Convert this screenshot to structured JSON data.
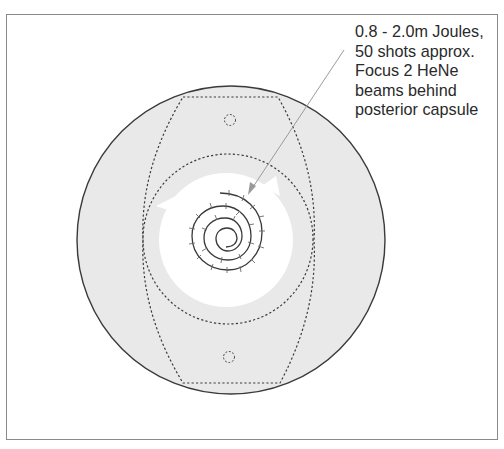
{
  "annotation": {
    "lines": [
      "0.8 - 2.0m Joules,",
      "50 shots approx.",
      "Focus 2 HeNe",
      "beams behind",
      "posterior capsule"
    ]
  },
  "colors": {
    "background": "#ffffff",
    "outer_circle_fill": "#e9e9e9",
    "outer_circle_stroke": "#3a3a3a",
    "inner_clear_zone": "#ffffff",
    "dashed_lines": "#3a3a3a",
    "spiral": "#3a3a3a",
    "pointer_line": "#9a9a9a",
    "frame_border": "#8a8a8a"
  }
}
